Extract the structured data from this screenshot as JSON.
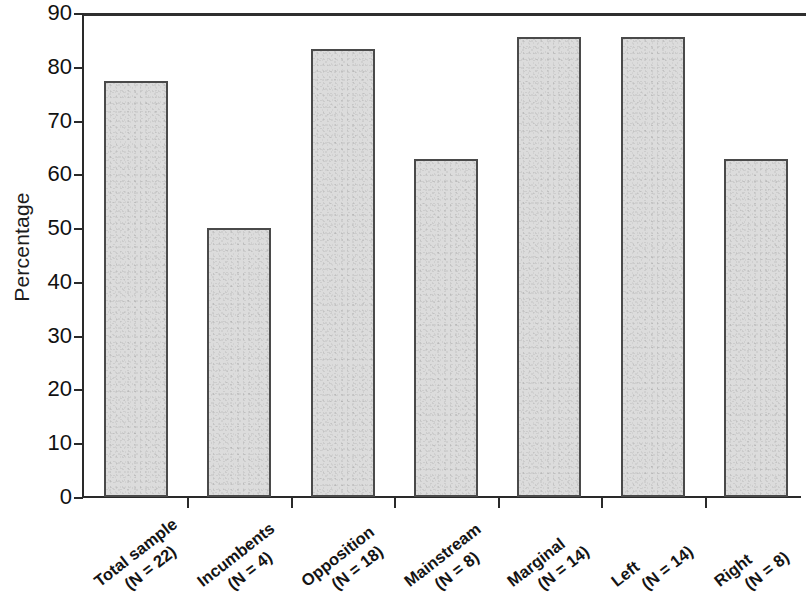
{
  "chart_data": {
    "type": "bar",
    "title": "",
    "xlabel": "",
    "ylabel": "Percentage",
    "ylim": [
      0,
      90
    ],
    "ytick_values": [
      0,
      10,
      20,
      30,
      40,
      50,
      60,
      70,
      80,
      90
    ],
    "ytick_labels": [
      "0",
      "10",
      "20",
      "30",
      "40",
      "50",
      "60",
      "70",
      "80",
      "90"
    ],
    "grid": false,
    "legend": null,
    "categories": [
      "Total sample (N = 22)",
      "Incumbents (N = 4)",
      "Opposition (N = 18)",
      "Mainstream (N = 8)",
      "Marginal (N = 14)",
      "Left (N = 14)",
      "Right (N = 8)"
    ],
    "category_lines": [
      {
        "line1": "Total sample",
        "line2": "(N = 22)"
      },
      {
        "line1": "Incumbents",
        "line2": "(N = 4)"
      },
      {
        "line1": "Opposition",
        "line2": "(N = 18)"
      },
      {
        "line1": "Mainstream",
        "line2": "(N = 8)"
      },
      {
        "line1": "Marginal",
        "line2": "(N = 14)"
      },
      {
        "line1": "Left",
        "line2": "(N = 14)"
      },
      {
        "line1": "Right",
        "line2": "(N = 8)"
      }
    ],
    "values": [
      77.3,
      50.0,
      83.4,
      62.8,
      85.6,
      85.6,
      62.8
    ],
    "bar_fill_color": "#dcdcdc",
    "bar_border_color": "#4a4a4a",
    "axis_color": "#2a2a2a"
  }
}
